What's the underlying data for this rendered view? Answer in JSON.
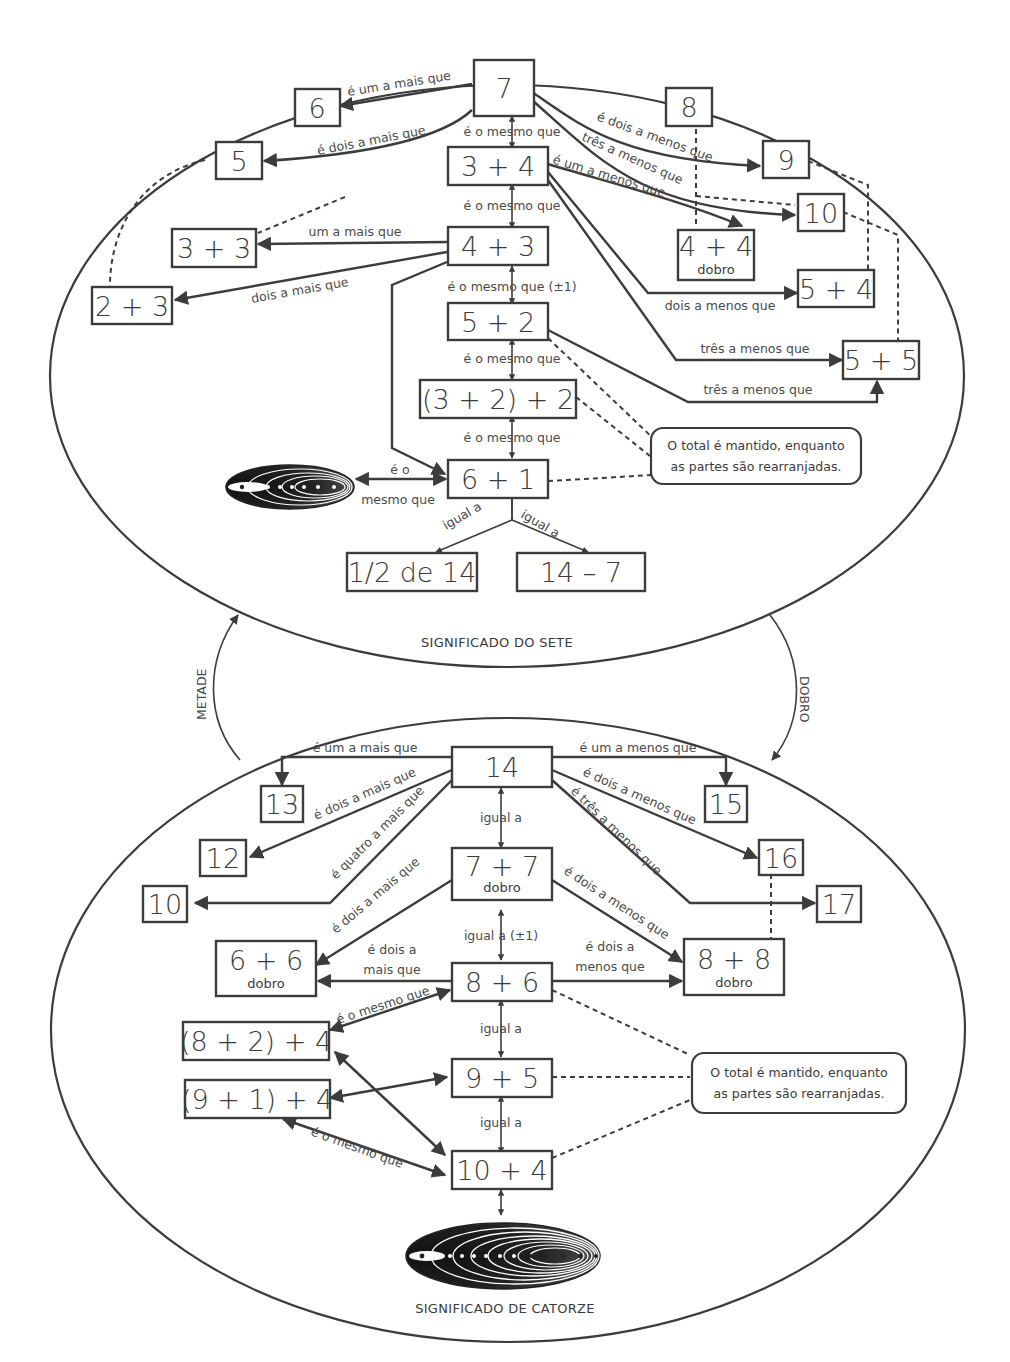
{
  "diagram": {
    "top": {
      "title": "SIGNIFICADO DO SETE",
      "boxes": {
        "n7": "7",
        "n6": "6",
        "n5": "5",
        "n8": "8",
        "n9": "9",
        "n10": "10",
        "b34": "3 + 4",
        "b43": "4 + 3",
        "b33": "3 + 3",
        "b23": "2 + 3",
        "b44": "4 + 4",
        "b44_sub": "dobro",
        "b54": "5 + 4",
        "b55": "5 + 5",
        "b52": "5 + 2",
        "b322": "(3 + 2) + 2",
        "b61": "6 + 1",
        "half14": "1/2 de 14",
        "m147": "14 – 7"
      },
      "labels": {
        "um_mais_7_6": "é um a mais que",
        "dois_mais_7_5": "é dois a mais que",
        "mesmo_7_34": "é o mesmo que",
        "mesmo_34_43": "é o mesmo que",
        "um_mais_43_33": "um a mais que",
        "dois_mais_43_23": "dois a mais que",
        "mesmo_43_52": "é o mesmo que (±1)",
        "mesmo_52_322": "é o mesmo que",
        "mesmo_322_61": "é o mesmo que",
        "mesmo_61_dots_1": "é o",
        "mesmo_61_dots_2": "mesmo que",
        "igual_left": "igual a",
        "igual_right": "igual a",
        "dois_menos_7_9": "é dois a menos que",
        "tres_menos_7_10": "três a menos que",
        "um_menos_34_44": "é um a menos que",
        "dois_menos_34_54": "dois a menos que",
        "tres_menos_34_55": "três a menos que",
        "tres_menos_52_55": "três a menos que"
      },
      "note_line1": "O total é mantido, enquanto",
      "note_line2": "as partes são rearranjadas."
    },
    "side": {
      "left": "METADE",
      "right": "DOBRO"
    },
    "bottom": {
      "title": "SIGNIFICADO DE CATORZE",
      "boxes": {
        "n14": "14",
        "n13": "13",
        "n12": "12",
        "n10": "10",
        "n15": "15",
        "n16": "16",
        "n17": "17",
        "b77": "7 + 7",
        "b77_sub": "dobro",
        "b66": "6 + 6",
        "b66_sub": "dobro",
        "b88": "8 + 8",
        "b88_sub": "dobro",
        "b86": "8 + 6",
        "b95": "9 + 5",
        "b104": "10 + 4",
        "b824": "(8 + 2) + 4",
        "b914": "(9 + 1) + 4"
      },
      "labels": {
        "um_mais_14_13": "é um a mais que",
        "dois_mais_14_12": "é dois a mais que",
        "quatro_mais_14_10": "é quatro a mais que",
        "um_menos_14_15": "é um a menos que",
        "dois_menos_14_16": "é dois a menos que",
        "tres_menos_14_17": "é três a menos que",
        "igual_14_77": "igual a",
        "dois_mais_77_66": "é dois a mais que",
        "dois_menos_77_88": "é dois a menos que",
        "igual_77_86": "igual a (±1)",
        "dois_mais_86_66_1": "é dois a",
        "dois_mais_86_66_2": "mais que",
        "dois_menos_86_88_1": "é dois a",
        "dois_menos_86_88_2": "menos que",
        "mesmo_86_824": "é o mesmo que",
        "igual_86_95": "igual a",
        "igual_95_104": "igual a",
        "mesmo_914_104": "é o mesmo que"
      },
      "note_line1": "O total é mantido, enquanto",
      "note_line2": "as partes são rearranjadas."
    }
  }
}
